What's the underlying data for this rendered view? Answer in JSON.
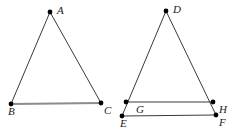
{
  "figure": {
    "width": 243,
    "height": 136,
    "background_color": "#ffffff",
    "stroke_color": "#3a3a3a",
    "highlight_color": "#8c8c8c",
    "vertex_dot_color": "#000000",
    "label_color": "#1a1a1a"
  },
  "shapes": [
    {
      "name": "triangle-abc",
      "type": "triangle",
      "vertices": [
        "A",
        "B",
        "C"
      ],
      "edges": [
        {
          "name": "edge-ab",
          "from": "A",
          "to": "B",
          "style": "normal"
        },
        {
          "name": "edge-ac",
          "from": "A",
          "to": "C",
          "style": "normal"
        },
        {
          "name": "edge-bc",
          "from": "B",
          "to": "C",
          "style": "highlighted"
        }
      ]
    },
    {
      "name": "triangle-def",
      "type": "triangle",
      "vertices": [
        "D",
        "E",
        "F"
      ],
      "edges": [
        {
          "name": "edge-de",
          "from": "D",
          "to": "E",
          "style": "normal"
        },
        {
          "name": "edge-df",
          "from": "D",
          "to": "F",
          "style": "normal"
        },
        {
          "name": "edge-ef",
          "from": "E",
          "to": "F",
          "style": "normal"
        },
        {
          "name": "edge-gh",
          "from": "G",
          "to": "H",
          "style": "normal"
        }
      ]
    }
  ],
  "points": {
    "A": {
      "label": "A",
      "x": 50,
      "y": 12,
      "label_x": 57,
      "label_y": 5
    },
    "B": {
      "label": "B",
      "x": 11,
      "y": 104,
      "label_x": 8,
      "label_y": 109
    },
    "C": {
      "label": "C",
      "x": 101,
      "y": 103,
      "label_x": 104,
      "label_y": 107
    },
    "D": {
      "label": "D",
      "x": 166,
      "y": 11,
      "label_x": 173,
      "label_y": 4
    },
    "E": {
      "label": "E",
      "x": 122,
      "y": 116,
      "label_x": 120,
      "label_y": 121
    },
    "F": {
      "label": "F",
      "x": 216,
      "y": 115,
      "label_x": 219,
      "label_y": 119
    },
    "G": {
      "label": "G",
      "x": 126,
      "y": 102,
      "label_x": 136,
      "label_y": 105
    },
    "H": {
      "label": "H",
      "x": 213,
      "y": 102,
      "label_x": 219,
      "label_y": 105
    }
  }
}
